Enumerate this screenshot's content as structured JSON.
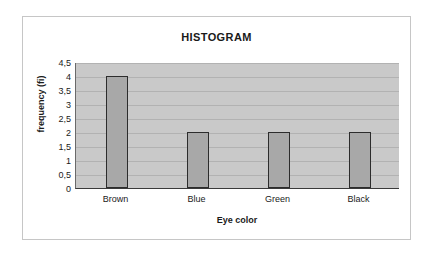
{
  "chart_data": {
    "type": "bar",
    "title": "HISTOGRAM",
    "xlabel": "Eye color",
    "ylabel": "frequency (fi)",
    "categories": [
      "Brown",
      "Blue",
      "Green",
      "Black"
    ],
    "values": [
      4,
      2,
      2,
      2
    ],
    "ylim": [
      0,
      4.5
    ],
    "ytick_labels": [
      "4,5",
      "4",
      "3,5",
      "3",
      "2,5",
      "2",
      "1,5",
      "1",
      "0,5",
      "0"
    ],
    "ytick_values": [
      4.5,
      4,
      3.5,
      3,
      2.5,
      2,
      1.5,
      1,
      0.5,
      0
    ],
    "grid": true,
    "legend": null,
    "colors": {
      "bar_fill": "#a8a8a8",
      "bar_edge": "#2c2c2c",
      "plot_background": "#c9c9c9",
      "gridline": "#b2b2b2",
      "frame_border": "#c6c6c6",
      "text": "#1a1a1a"
    }
  }
}
